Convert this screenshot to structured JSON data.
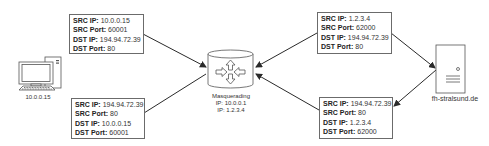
{
  "diagram": {
    "nodes": {
      "client": {
        "label": "10.0.0.15",
        "icon": "desktop-computer-icon"
      },
      "router": {
        "label_lines": [
          "Masquerading",
          "IP: 10.0.0.1",
          "IP: 1.2.3.4"
        ],
        "icon": "router-icon"
      },
      "server": {
        "label": "fh-stralsund.de",
        "icon": "server-icon"
      }
    },
    "packets": [
      {
        "id": "client-to-router",
        "rows": [
          {
            "key": "SRC IP:",
            "value": "10.0.0.15"
          },
          {
            "key": "SRC Port:",
            "value": "60001"
          },
          {
            "key": "DST IP:",
            "value": "194.94.72.39"
          },
          {
            "key": "DST Port:",
            "value": "80"
          }
        ]
      },
      {
        "id": "router-to-client",
        "rows": [
          {
            "key": "SRC IP:",
            "value": "194.94.72.39"
          },
          {
            "key": "SRC Port:",
            "value": "80"
          },
          {
            "key": "DST IP:",
            "value": "10.0.0.15"
          },
          {
            "key": "DST Port:",
            "value": "60001"
          }
        ]
      },
      {
        "id": "router-to-server",
        "rows": [
          {
            "key": "SRC IP:",
            "value": "1.2.3.4"
          },
          {
            "key": "SRC Port:",
            "value": "62000"
          },
          {
            "key": "DST IP:",
            "value": "194.94.72.39"
          },
          {
            "key": "DST Port:",
            "value": "80"
          }
        ]
      },
      {
        "id": "server-to-router",
        "rows": [
          {
            "key": "SRC IP:",
            "value": "194.94.72.39"
          },
          {
            "key": "SRC Port:",
            "value": "80"
          },
          {
            "key": "DST IP:",
            "value": "1.2.3.4"
          },
          {
            "key": "DST Port:",
            "value": "62000"
          }
        ]
      }
    ],
    "colors": {
      "line": "#2a2a2a",
      "border": "#6b6b6b"
    }
  }
}
